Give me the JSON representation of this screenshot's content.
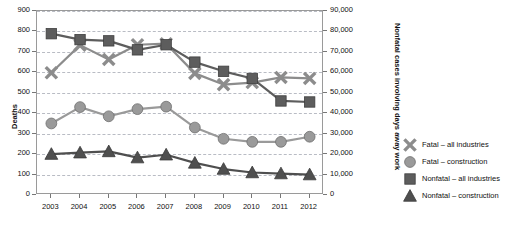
{
  "chart_data": {
    "type": "line",
    "title": "",
    "xlabel": "",
    "ylabel": "Deaths",
    "y2label": "Nonfatal cases involving days away work",
    "categories": [
      "2003",
      "2004",
      "2005",
      "2006",
      "2007",
      "2008",
      "2009",
      "2010",
      "2011",
      "2012"
    ],
    "ylim": [
      0,
      900
    ],
    "yticks": [
      "0",
      "100",
      "200",
      "300",
      "400",
      "500",
      "600",
      "700",
      "800",
      "900"
    ],
    "y2lim": [
      0,
      90000
    ],
    "y2ticks": [
      "0",
      "10,000",
      "20,000",
      "30,000",
      "40,000",
      "50,000",
      "60,000",
      "70,000",
      "80,000",
      "90,000"
    ],
    "grid": true,
    "legend_position": "right",
    "series": [
      {
        "name": "Fatal – all industries",
        "marker": "x-cross",
        "axis": "left",
        "color": "#8c8c8c",
        "values": [
          598,
          733,
          663,
          735,
          740,
          595,
          540,
          550,
          575,
          570
        ]
      },
      {
        "name": "Fatal – construction",
        "marker": "circle",
        "axis": "left",
        "color": "#9a9a9a",
        "values": [
          350,
          430,
          385,
          420,
          432,
          330,
          275,
          260,
          260,
          285
        ]
      },
      {
        "name": "Nonfatal – all industries",
        "marker": "square",
        "axis": "right",
        "color": "#5d5d5d",
        "values": [
          78900,
          76000,
          75400,
          71000,
          73500,
          65000,
          60500,
          57000,
          46000,
          45500
        ]
      },
      {
        "name": "Nonfatal – construction",
        "marker": "triangle",
        "axis": "left",
        "color": "#4f4f4f",
        "values": [
          200,
          207,
          213,
          183,
          197,
          157,
          127,
          110,
          105,
          100
        ]
      }
    ]
  },
  "legend": {
    "items": [
      {
        "label": "Fatal – all industries",
        "icon": "x-cross-icon"
      },
      {
        "label": "Fatal – construction",
        "icon": "circle-icon"
      },
      {
        "label": "Nonfatal – all industries",
        "icon": "square-icon"
      },
      {
        "label": "Nonfatal – construction",
        "icon": "triangle-icon"
      }
    ]
  },
  "colors": {
    "fatal_all": "#8c8c8c",
    "fatal_construction": "#9a9a9a",
    "nonfatal_all": "#5d5d5d",
    "nonfatal_construction": "#4f4f4f",
    "grid": "#b9bcc4",
    "frame": "#9a9a9a",
    "text": "#111111"
  }
}
